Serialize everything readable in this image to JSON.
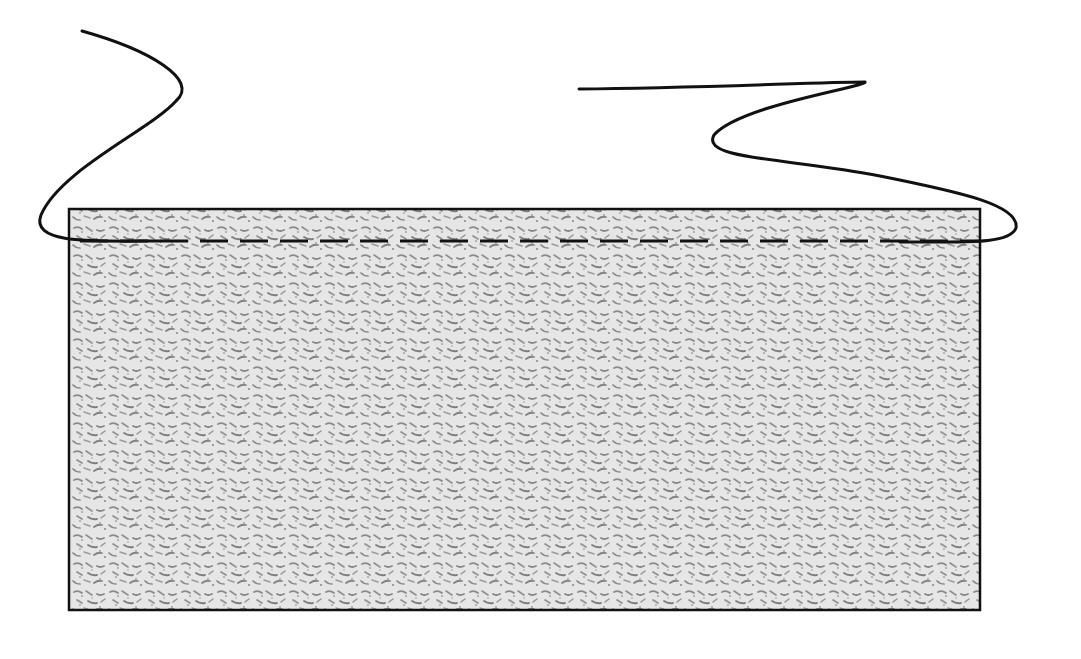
{
  "diagram": {
    "colors": {
      "background": "#ffffff",
      "block_fill": "#e6e6e6",
      "speckle": "#8a8a8a",
      "stroke": "#111111"
    },
    "block": {
      "x": 69,
      "y": 209,
      "width": 911,
      "height": 401,
      "stroke_width": 2.5
    },
    "dashed_line": {
      "y": 241,
      "x_start": 70,
      "x_end": 979,
      "dash": "28 12",
      "stroke_width": 3
    },
    "curves": [
      {
        "name": "left-curve",
        "path": "M 82 31 C 150 50, 200 80, 176 101 C 150 130, 60 170, 41 215 C 30 245, 95 241, 160 241"
      },
      {
        "name": "right-curve",
        "path": "M 579 89 C 700 88, 820 82, 865 82 C 870 86, 740 105, 714 135 C 700 160, 790 158, 880 176 C 960 192, 1020 205, 1016 228 C 1010 244, 970 242, 900 242"
      }
    ]
  }
}
